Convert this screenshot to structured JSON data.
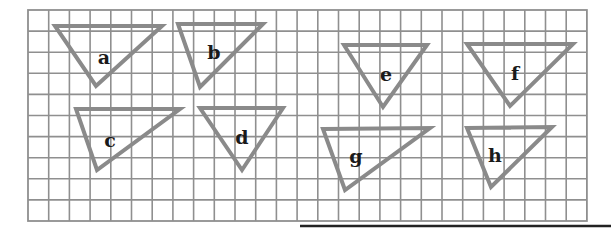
{
  "figure": {
    "grid": {
      "left": 28,
      "top": 10,
      "columns": 27,
      "rows": 10,
      "cell_width": 20.7,
      "cell_height": 21.1,
      "line_color": "#8f8f8f"
    },
    "triangle_color": "#8a8a8a",
    "label_color": "#1a1a1a",
    "triangles": [
      {
        "label": "a",
        "points": [
          [
            55,
            26
          ],
          [
            162,
            26
          ],
          [
            96,
            86
          ]
        ],
        "label_pos": [
          104,
          64
        ]
      },
      {
        "label": "b",
        "points": [
          [
            178,
            24
          ],
          [
            263,
            24
          ],
          [
            200,
            87
          ]
        ],
        "label_pos": [
          214,
          59
        ]
      },
      {
        "label": "c",
        "points": [
          [
            76,
            109
          ],
          [
            180,
            109
          ],
          [
            97,
            170
          ]
        ],
        "label_pos": [
          110,
          147
        ]
      },
      {
        "label": "d",
        "points": [
          [
            200,
            108
          ],
          [
            283,
            108
          ],
          [
            242,
            170
          ]
        ],
        "label_pos": [
          242,
          144
        ]
      },
      {
        "label": "e",
        "points": [
          [
            344,
            45
          ],
          [
            427,
            45
          ],
          [
            383,
            107
          ]
        ],
        "label_pos": [
          386,
          81
        ]
      },
      {
        "label": "f",
        "points": [
          [
            467,
            44
          ],
          [
            573,
            44
          ],
          [
            510,
            106
          ]
        ],
        "label_pos": [
          515,
          80
        ]
      },
      {
        "label": "g",
        "points": [
          [
            323,
            129
          ],
          [
            430,
            128
          ],
          [
            345,
            190
          ]
        ],
        "label_pos": [
          356,
          163
        ]
      },
      {
        "label": "h",
        "points": [
          [
            467,
            128
          ],
          [
            552,
            127
          ],
          [
            491,
            187
          ]
        ],
        "label_pos": [
          495,
          162
        ]
      }
    ],
    "page_rule": {
      "x1": 300,
      "x2": 611,
      "y": 226,
      "color": "#222222"
    }
  }
}
